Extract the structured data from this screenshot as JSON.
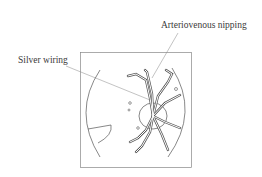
{
  "diagram": {
    "labels": {
      "av_nipping": "Arteriovenous nipping",
      "silver_wiring": "Silver wiring"
    },
    "colors": {
      "line": "#555555",
      "leader": "#9a9a9a",
      "background": "#ffffff"
    }
  }
}
